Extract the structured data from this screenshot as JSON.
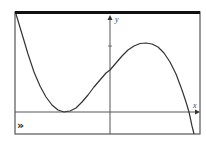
{
  "screen": {
    "frame_color": "#555555",
    "top_bar_color": "#111111",
    "curve_color": "#333333",
    "axis_color": "#555555",
    "background": "#ffffff"
  },
  "chart_data": {
    "type": "line",
    "title": "",
    "xlabel": "x",
    "ylabel": "y",
    "grid": false,
    "legend": null,
    "pixel_frame": {
      "left": 15,
      "top": 12,
      "right": 200,
      "bottom": 134
    },
    "pixel_axes": {
      "x_axis_y": 112,
      "y_axis_x": 110
    },
    "y_axis_ticks_px": [
      46
    ],
    "series": [
      {
        "name": "f(x)",
        "points_px": [
          [
            16,
            14
          ],
          [
            22,
            34
          ],
          [
            28,
            54
          ],
          [
            34,
            72
          ],
          [
            40,
            86
          ],
          [
            46,
            97
          ],
          [
            52,
            105
          ],
          [
            58,
            110
          ],
          [
            64,
            112
          ],
          [
            70,
            111
          ],
          [
            76,
            108
          ],
          [
            82,
            102
          ],
          [
            88,
            95
          ],
          [
            94,
            87
          ],
          [
            100,
            80
          ],
          [
            106,
            73
          ],
          [
            110,
            70
          ],
          [
            116,
            63
          ],
          [
            122,
            56
          ],
          [
            128,
            50
          ],
          [
            134,
            46
          ],
          [
            140,
            43.5
          ],
          [
            146,
            43
          ],
          [
            152,
            44
          ],
          [
            158,
            47
          ],
          [
            164,
            53
          ],
          [
            170,
            62
          ],
          [
            176,
            74
          ],
          [
            182,
            90
          ],
          [
            186,
            102
          ],
          [
            189,
            112
          ],
          [
            192,
            126
          ],
          [
            194,
            134
          ]
        ]
      }
    ],
    "features": {
      "local_minimum_px": [
        64,
        112
      ],
      "local_maximum_px": [
        146,
        43
      ],
      "y_intercept_px": [
        110,
        70
      ],
      "x_intercepts_px": [
        [
          64,
          112
        ],
        [
          189,
          112
        ]
      ]
    }
  },
  "labels": {
    "x_axis": "x",
    "y_axis": "y",
    "trace_indicator": "»"
  }
}
